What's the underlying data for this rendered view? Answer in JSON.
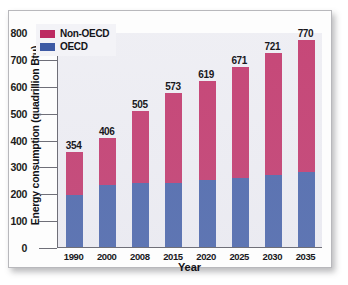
{
  "chart_data": {
    "type": "bar",
    "subtype": "stacked-bar",
    "title": "",
    "xlabel": "Year",
    "ylabel": "Energy consumption (quadrillion Btu)",
    "categories": [
      "1990",
      "2000",
      "2008",
      "2015",
      "2020",
      "2025",
      "2030",
      "2035"
    ],
    "series": [
      {
        "name": "OECD",
        "color": "#3d5aa4",
        "values": [
          193,
          232,
          238,
          240,
          248,
          258,
          268,
          278
        ]
      },
      {
        "name": "Non-OECD",
        "color": "#bd2a62",
        "values": [
          161,
          174,
          267,
          333,
          371,
          413,
          453,
          492
        ]
      }
    ],
    "totals": [
      354,
      406,
      505,
      573,
      619,
      671,
      721,
      770
    ],
    "data_labels": [
      "354",
      "406",
      "505",
      "573",
      "619",
      "671",
      "721",
      "770"
    ],
    "ylim": [
      0,
      800
    ],
    "yticks": [
      0,
      100,
      200,
      300,
      400,
      500,
      600,
      700,
      800
    ],
    "ytick_labels": [
      "0",
      "100",
      "200",
      "300",
      "400",
      "500",
      "600",
      "700",
      "800"
    ],
    "grid": false,
    "legend_position": "top-left",
    "legend": [
      {
        "label": "Non-OECD",
        "color": "#bd2a62"
      },
      {
        "label": "OECD",
        "color": "#3d5aa4"
      }
    ],
    "plot_background": "#ececf2",
    "axis_color": "#6f6f78"
  }
}
